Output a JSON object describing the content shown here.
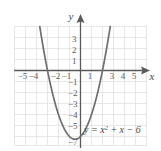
{
  "chart_data": {
    "type": "line",
    "title": "",
    "subtitle": "",
    "xlabel": "x",
    "ylabel": "y",
    "equation_label": "y = x",
    "equation_exponent": "2",
    "equation_rest": " + x − 6",
    "function": "y = x^2 + x - 6",
    "xlim": [
      -6,
      6
    ],
    "ylim": [
      -7.8,
      3.8
    ],
    "grid": true,
    "grid_color": "#d9d9d9",
    "curve_color": "#6b6b6b",
    "axis_color": "#555555",
    "background": "#ffffff",
    "legend_position": "none",
    "x_ticks": [
      -5,
      -4,
      -3,
      -2,
      -1,
      1,
      2,
      3,
      4,
      5
    ],
    "x_tick_labels": [
      "−5",
      "−4",
      "",
      "−2",
      "−1",
      "1",
      "",
      "3",
      "4",
      "5"
    ],
    "y_ticks": [
      3,
      2,
      1,
      -1,
      -2,
      -3,
      -4,
      -5,
      -6,
      -7
    ],
    "y_tick_labels": [
      "3",
      "2",
      "1",
      "−1",
      "−2",
      "−3",
      "−4",
      "−5",
      "",
      "−7"
    ],
    "x_roots": [
      -3,
      2
    ],
    "y_intercept": -6,
    "vertex": [
      -0.5,
      -6.25
    ],
    "series": [
      {
        "name": "y = x^2 + x - 6",
        "x": [
          -3.0,
          -2.8,
          -2.6,
          -2.4,
          -2.2,
          -2.0,
          -1.8,
          -1.6,
          -1.4,
          -1.2,
          -1.0,
          -0.8,
          -0.6,
          -0.5,
          -0.4,
          -0.2,
          0.0,
          0.2,
          0.4,
          0.6,
          0.8,
          1.0,
          1.2,
          1.4,
          1.6,
          1.8,
          2.0,
          2.2,
          2.4,
          2.6,
          2.8,
          3.0
        ],
        "y": [
          0.0,
          -1.0,
          -1.84,
          -2.64,
          -3.36,
          -4.0,
          -4.56,
          -5.04,
          -5.44,
          -5.76,
          -6.0,
          -6.16,
          -6.24,
          -6.25,
          -6.24,
          -6.16,
          -6.0,
          -5.76,
          -5.44,
          -5.04,
          -4.56,
          -4.0,
          -3.36,
          -2.64,
          -1.84,
          -0.96,
          0.0,
          1.04,
          2.16,
          3.36,
          4.64,
          6.0
        ]
      }
    ]
  }
}
